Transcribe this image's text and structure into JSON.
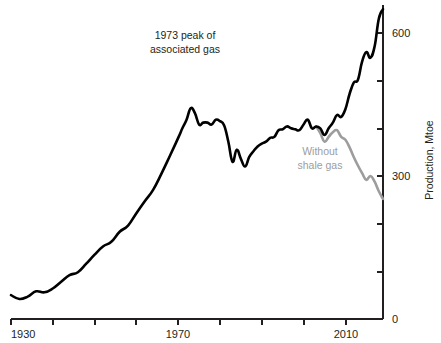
{
  "chart_data": {
    "type": "line",
    "title": "",
    "xlabel": "",
    "ylabel": "Production, Mtoe",
    "xlim": [
      1930,
      2019
    ],
    "ylim": [
      0,
      670
    ],
    "yticks": [
      0,
      100,
      200,
      300,
      400,
      500,
      600
    ],
    "ytick_labels_shown": [
      "0",
      "300",
      "600"
    ],
    "xticks": [
      1930,
      1940,
      1950,
      1960,
      1970,
      1980,
      1990,
      2000,
      2010
    ],
    "xtick_labels_shown": [
      "1930",
      "1970",
      "2010"
    ],
    "grid": false,
    "legend": "none",
    "annotations": [
      {
        "name": "peak-annotation",
        "line1": "1973 peak of",
        "line2": "associated gas",
        "x": 1968,
        "y": 630,
        "color": "#231f20"
      },
      {
        "name": "without-shale-annotation",
        "line1": "Without",
        "line2": "shale gas",
        "x": 2002,
        "y": 345,
        "color": "#9d9d9d"
      }
    ],
    "colors": {
      "total_production": "#000000",
      "without_shale_gas": "#9d9d9d",
      "axis": "#231f20",
      "background": "#ffffff"
    },
    "series": [
      {
        "name": "US natural gas production (total)",
        "color": "#000000",
        "x": [
          1930,
          1932,
          1934,
          1936,
          1938,
          1940,
          1942,
          1944,
          1946,
          1948,
          1950,
          1952,
          1954,
          1956,
          1958,
          1960,
          1962,
          1964,
          1966,
          1968,
          1970,
          1971,
          1972,
          1973,
          1974,
          1975,
          1976,
          1977,
          1978,
          1979,
          1980,
          1981,
          1982,
          1983,
          1984,
          1985,
          1986,
          1987,
          1988,
          1989,
          1990,
          1991,
          1992,
          1993,
          1994,
          1995,
          1996,
          1997,
          1998,
          1999,
          2000,
          2001,
          2002,
          2003,
          2004,
          2005,
          2006,
          2007,
          2008,
          2009,
          2010,
          2011,
          2012,
          2013,
          2014,
          2015,
          2016,
          2017,
          2018,
          2019
        ],
        "values": [
          50,
          42,
          47,
          58,
          56,
          64,
          78,
          92,
          98,
          116,
          135,
          152,
          162,
          183,
          196,
          222,
          247,
          271,
          305,
          342,
          380,
          400,
          418,
          442,
          432,
          408,
          412,
          412,
          408,
          418,
          415,
          406,
          372,
          330,
          355,
          336,
          320,
          340,
          352,
          362,
          368,
          372,
          380,
          382,
          396,
          398,
          404,
          400,
          398,
          396,
          408,
          418,
          400,
          404,
          400,
          386,
          400,
          412,
          428,
          424,
          440,
          472,
          496,
          502,
          540,
          560,
          548,
          572,
          630,
          650
        ]
      },
      {
        "name": "Without shale gas",
        "color": "#9d9d9d",
        "x": [
          2003,
          2004,
          2005,
          2006,
          2007,
          2008,
          2009,
          2010,
          2011,
          2012,
          2013,
          2014,
          2015,
          2016,
          2017,
          2018,
          2019
        ],
        "values": [
          404,
          390,
          372,
          382,
          392,
          396,
          382,
          376,
          360,
          340,
          322,
          306,
          292,
          300,
          288,
          268,
          252
        ]
      }
    ]
  },
  "axis": {
    "y_title": "Production, Mtoe",
    "y_labels": {
      "zero": "0",
      "three_hundred": "300",
      "six_hundred": "600"
    },
    "x_labels": {
      "start": "1930",
      "mid": "1970",
      "end": "2010"
    }
  },
  "annotations": {
    "peak": {
      "line1": "1973 peak of",
      "line2": "associated gas"
    },
    "without_shale": {
      "line1": "Without",
      "line2": "shale gas"
    }
  }
}
